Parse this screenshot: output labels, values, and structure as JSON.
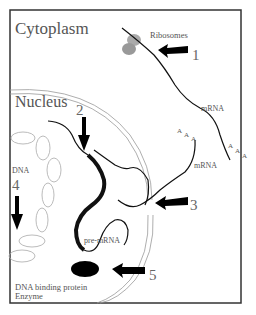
{
  "diagram": {
    "title_cytoplasm": "Cytoplasm",
    "title_nucleus": "Nucleus",
    "labels": {
      "ribosomes": "Ribosomes",
      "mrna_top": "mRNA",
      "mrna_mid": "mRNA",
      "pre_mrna": "pre-mRNA",
      "dna": "DNA",
      "dna_binding_line1": "DNA binding protein",
      "dna_binding_line2": "Enzyme",
      "poly_a_1": "A A A",
      "poly_a_2": "A A A"
    },
    "markers": [
      "1",
      "2",
      "3",
      "4",
      "5"
    ]
  }
}
